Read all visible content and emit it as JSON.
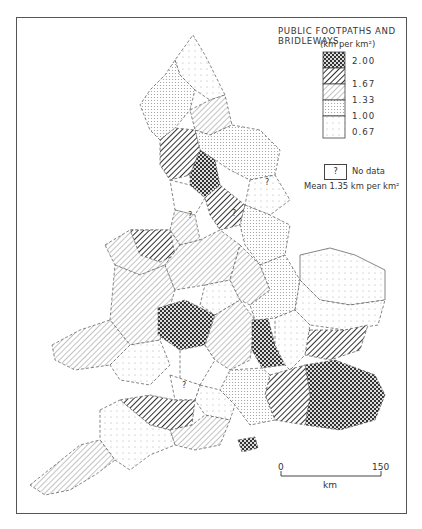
{
  "legend": {
    "title": "PUBLIC FOOTPATHS AND BRIDLEWAYS",
    "unit": "(km per km²)",
    "classes": [
      {
        "label": "2.00",
        "pattern": "crosshatch-dense"
      },
      {
        "label": "1.67",
        "pattern": "diagonal-dense"
      },
      {
        "label": "1.33",
        "pattern": "diagonal-light"
      },
      {
        "label": "1.00",
        "pattern": "dots-dense"
      },
      {
        "label": "0.67",
        "pattern": "dots-light"
      }
    ],
    "no_data_symbol": "?",
    "no_data_label": "No data",
    "mean": "Mean 1.35 km per km²"
  },
  "scale_bar": {
    "start": "0",
    "end": "150",
    "unit": "km"
  },
  "map": {
    "subject": "England and Wales counties",
    "no_data_markers": [
      "?",
      "?",
      "?",
      "?"
    ]
  }
}
